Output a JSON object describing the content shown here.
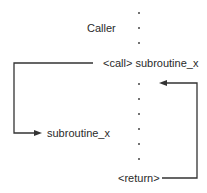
{
  "diagram": {
    "caller_label": "Caller",
    "call_label": "<call> subroutine_x",
    "subroutine_label": "subroutine_x",
    "return_label": "<return>",
    "line_color": "#333333",
    "dot_color": "#444444"
  }
}
